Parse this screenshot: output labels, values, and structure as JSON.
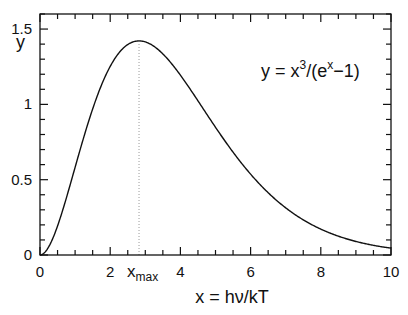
{
  "chart_data": {
    "type": "line",
    "title": "",
    "xlabel": "x = hν/kT",
    "ylabel": "y",
    "annotation": {
      "formula_base": "y = x",
      "formula_exp": "3",
      "formula_div": "/(e",
      "formula_exp2": "x",
      "formula_tail": "−1)"
    },
    "xmax_label_main": "x",
    "xmax_label_sub": "max",
    "xmax_value": 2.821,
    "ymax_value": 1.421,
    "xlim": [
      0,
      10
    ],
    "ylim": [
      0,
      1.6
    ],
    "x_ticks": [
      0,
      2,
      4,
      6,
      8,
      10
    ],
    "x_tick_labels": [
      "0",
      "2",
      "4",
      "6",
      "8",
      "10"
    ],
    "y_ticks": [
      0,
      0.5,
      1,
      1.5
    ],
    "y_tick_labels": [
      "0",
      "0.5",
      "1",
      "1.5"
    ],
    "grid": false,
    "legend": "none",
    "series": [
      {
        "name": "x^3/(e^x-1)",
        "x": [
          0,
          0.5,
          1,
          1.5,
          2,
          2.5,
          2.821,
          3,
          3.5,
          4,
          4.5,
          5,
          6,
          7,
          8,
          9,
          10
        ],
        "y": [
          0,
          0.193,
          0.582,
          0.969,
          1.252,
          1.397,
          1.421,
          1.417,
          1.351,
          1.235,
          1.098,
          0.848,
          0.537,
          0.314,
          0.172,
          0.09,
          0.045
        ]
      }
    ],
    "colors": {
      "curve": "#111111",
      "axes": "#111111",
      "marker_line": "#999999"
    }
  }
}
